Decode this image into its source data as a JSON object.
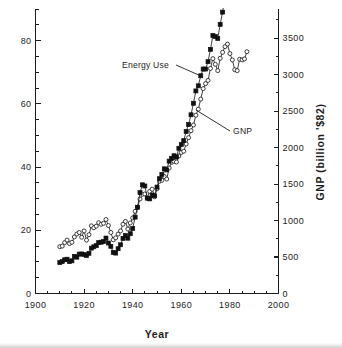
{
  "chart_data": {
    "type": "line",
    "title": "",
    "subtitle": "",
    "xlabel": "Year",
    "ylabel": "",
    "ylabel_right": "GNP  (billion  '$82)",
    "xlim": [
      1900,
      2000
    ],
    "ylim_left": [
      0,
      90
    ],
    "ylim_right": [
      0,
      3900
    ],
    "grid": false,
    "legend_position": "inline-annotations",
    "xticks": [
      1900,
      1920,
      1940,
      1960,
      1980,
      2000
    ],
    "xticklabels": [
      "1900",
      "1920",
      "1940",
      "1960",
      "1980",
      "2000"
    ],
    "xminor_step": 5,
    "yticks_left": [
      0,
      20,
      40,
      60,
      80
    ],
    "yticklabels_left": [
      "0",
      "20",
      "40",
      "60",
      "80"
    ],
    "yminor_step_left": 5,
    "yticks_right": [
      0,
      500,
      1000,
      1500,
      2000,
      2500,
      3000,
      3500
    ],
    "yticklabels_right": [
      "0",
      "500",
      "1000",
      "1500",
      "2000",
      "2500",
      "3000",
      "3500"
    ],
    "yminor_step_right": 250,
    "annotations": [
      {
        "text": "Energy Use",
        "x": 1938,
        "y_left": 69.5
      },
      {
        "text": "GNP",
        "x": 1973,
        "y_left": 52.0
      }
    ],
    "x": [
      1910,
      1911,
      1912,
      1913,
      1914,
      1915,
      1916,
      1917,
      1918,
      1919,
      1920,
      1921,
      1922,
      1923,
      1924,
      1925,
      1926,
      1927,
      1928,
      1929,
      1930,
      1931,
      1932,
      1933,
      1934,
      1935,
      1936,
      1937,
      1938,
      1939,
      1940,
      1941,
      1942,
      1943,
      1944,
      1945,
      1946,
      1947,
      1948,
      1949,
      1950,
      1951,
      1952,
      1953,
      1954,
      1955,
      1956,
      1957,
      1958,
      1959,
      1960,
      1961,
      1962,
      1963,
      1964,
      1965,
      1966,
      1967,
      1968,
      1969,
      1970,
      1971,
      1972,
      1973,
      1974,
      1975,
      1976,
      1977,
      1978,
      1979,
      1980,
      1981,
      1982,
      1983,
      1984,
      1985,
      1986,
      1987
    ],
    "series": [
      {
        "name": "Energy Use",
        "units": "quadrillion BTU",
        "axis": "left",
        "marker": "open-circle",
        "values": [
          14.8,
          15.0,
          16.1,
          16.9,
          15.8,
          16.2,
          17.9,
          18.8,
          19.3,
          17.8,
          19.8,
          16.9,
          18.6,
          21.4,
          20.8,
          21.3,
          22.4,
          21.9,
          22.2,
          23.4,
          21.5,
          19.3,
          17.0,
          17.6,
          18.8,
          19.8,
          21.9,
          22.8,
          20.4,
          22.3,
          23.9,
          26.0,
          27.3,
          29.9,
          31.4,
          31.5,
          30.2,
          32.3,
          33.0,
          30.6,
          33.1,
          35.5,
          35.8,
          37.0,
          36.2,
          39.7,
          41.5,
          41.8,
          41.6,
          43.5,
          44.6,
          45.0,
          47.3,
          49.3,
          51.5,
          53.3,
          56.4,
          58.3,
          61.5,
          64.8,
          66.4,
          67.4,
          71.2,
          74.3,
          72.5,
          70.5,
          74.4,
          76.3,
          78.1,
          78.9,
          75.9,
          73.9,
          70.8,
          70.5,
          74.1,
          73.9,
          74.2,
          76.5
        ]
      },
      {
        "name": "GNP",
        "units": "billion 1982 dollars",
        "axis": "right",
        "marker": "filled-square",
        "values": [
          425,
          437,
          462,
          470,
          437,
          448,
          509,
          498,
          540,
          542,
          535,
          520,
          551,
          622,
          640,
          656,
          698,
          703,
          712,
          760,
          692,
          647,
          563,
          554,
          614,
          668,
          756,
          794,
          758,
          820,
          891,
          1047,
          1182,
          1383,
          1490,
          1474,
          1307,
          1297,
          1350,
          1340,
          1459,
          1574,
          1632,
          1709,
          1694,
          1815,
          1853,
          1888,
          1871,
          1991,
          2043,
          2095,
          2221,
          2316,
          2450,
          2608,
          2777,
          2847,
          2985,
          3077,
          3077,
          3178,
          3347,
          3536,
          3522,
          3495,
          3690,
          3857,
          4075,
          4210,
          4194,
          4298,
          4214,
          4406,
          4712,
          4866,
          5005,
          5175
        ]
      }
    ]
  },
  "axes": {
    "x_title": "Year",
    "y_right_title": "GNP  (billion  '$82)"
  }
}
